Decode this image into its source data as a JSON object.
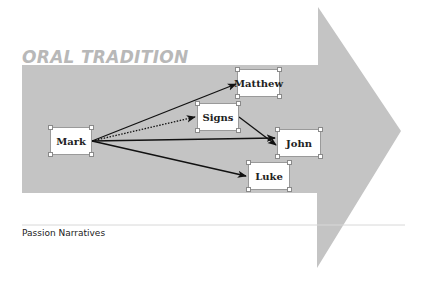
{
  "diagram": {
    "section_title": "ORAL TRADITION",
    "footer_label": "Passion Narratives",
    "colors": {
      "arrow_fill": "#c4c4c4",
      "title_color": "#b8b8b8",
      "node_fill": "#ffffff",
      "edge_color": "#111111",
      "divider": "#d8d8d8"
    },
    "nodes": [
      {
        "id": "mark",
        "label": "Mark"
      },
      {
        "id": "matthew",
        "label": "Matthew"
      },
      {
        "id": "signs",
        "label": "Signs"
      },
      {
        "id": "john",
        "label": "John"
      },
      {
        "id": "luke",
        "label": "Luke"
      }
    ],
    "edges": [
      {
        "from": "Mark",
        "to": "Matthew",
        "style": "solid"
      },
      {
        "from": "Mark",
        "to": "Signs",
        "style": "dotted"
      },
      {
        "from": "Mark",
        "to": "John",
        "style": "solid"
      },
      {
        "from": "Mark",
        "to": "Luke",
        "style": "solid"
      },
      {
        "from": "Signs",
        "to": "John",
        "style": "solid"
      }
    ]
  }
}
